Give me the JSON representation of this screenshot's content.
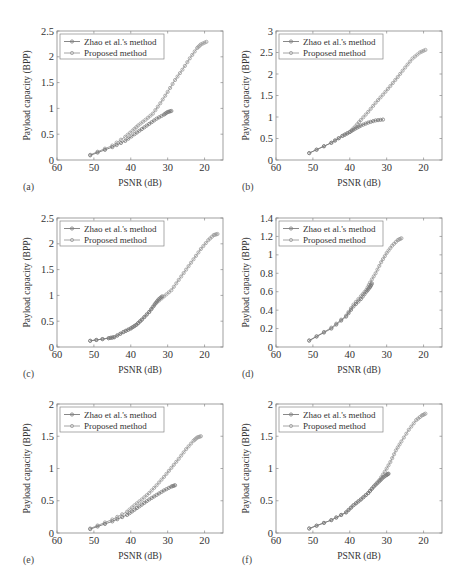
{
  "figure": {
    "xlabel": "PSNR (dB)",
    "ylabel": "Payload capacity (BPP)",
    "legend": [
      "Zhao et al.'s method",
      "Proposed method"
    ],
    "series_colors": {
      "zhao": "#7a7a7a",
      "proposed": "#9a9a9a"
    }
  },
  "chart_data": [
    {
      "panel": "(a)",
      "type": "line",
      "xlabel": "PSNR (dB)",
      "ylabel": "Payload capacity (BPP)",
      "xlim": [
        60,
        15
      ],
      "x_reversed": true,
      "xticks": [
        60,
        50,
        40,
        30,
        20
      ],
      "ylim": [
        0,
        2.5
      ],
      "yticks": [
        0,
        0.5,
        1,
        1.5,
        2,
        2.5
      ],
      "ytick_labels": [
        "0",
        "0.5",
        "1",
        "1.5",
        "2",
        "2.5"
      ],
      "legend_position": "upper left",
      "grid": false,
      "series": [
        {
          "name": "Zhao et al.'s method",
          "x": [
            51,
            45,
            41.5,
            39,
            37,
            35,
            33,
            31,
            30,
            29
          ],
          "y": [
            0.09,
            0.25,
            0.37,
            0.5,
            0.6,
            0.7,
            0.8,
            0.88,
            0.93,
            0.95
          ]
        },
        {
          "name": "Proposed method",
          "x": [
            51,
            45,
            41.5,
            39.5,
            38,
            36,
            34,
            32,
            30,
            28,
            26,
            24,
            22,
            21,
            19.5
          ],
          "y": [
            0.1,
            0.28,
            0.45,
            0.57,
            0.67,
            0.78,
            0.9,
            1.1,
            1.32,
            1.55,
            1.75,
            1.97,
            2.17,
            2.24,
            2.29
          ]
        }
      ]
    },
    {
      "panel": "(b)",
      "type": "line",
      "xlabel": "PSNR (dB)",
      "ylabel": "Payload capacity (BPP)",
      "xlim": [
        60,
        15
      ],
      "x_reversed": true,
      "xticks": [
        60,
        50,
        40,
        30,
        20
      ],
      "ylim": [
        0,
        3
      ],
      "yticks": [
        0,
        0.5,
        1,
        1.5,
        2,
        2.5,
        3
      ],
      "ytick_labels": [
        "0",
        "0.5",
        "1",
        "1.5",
        "2",
        "2.5",
        "3"
      ],
      "legend_position": "upper left",
      "grid": false,
      "series": [
        {
          "name": "Zhao et al.'s method",
          "x": [
            51,
            45,
            42,
            40,
            38.5,
            37,
            35,
            33,
            31
          ],
          "y": [
            0.16,
            0.4,
            0.56,
            0.65,
            0.73,
            0.8,
            0.87,
            0.92,
            0.94
          ]
        },
        {
          "name": "Proposed method",
          "x": [
            51,
            45,
            42,
            40,
            38.5,
            37,
            35,
            33,
            31,
            29,
            27,
            25,
            23,
            21,
            19.5
          ],
          "y": [
            0.16,
            0.4,
            0.56,
            0.65,
            0.78,
            0.93,
            1.12,
            1.33,
            1.52,
            1.72,
            1.93,
            2.15,
            2.36,
            2.5,
            2.56
          ]
        }
      ]
    },
    {
      "panel": "(c)",
      "type": "line",
      "xlabel": "PSNR (dB)",
      "ylabel": "Payload capacity (BPP)",
      "xlim": [
        60,
        15
      ],
      "x_reversed": true,
      "xticks": [
        60,
        50,
        40,
        30,
        20
      ],
      "ylim": [
        0,
        2.5
      ],
      "yticks": [
        0,
        0.5,
        1,
        1.5,
        2,
        2.5
      ],
      "ytick_labels": [
        "0",
        "0.5",
        "1",
        "1.5",
        "2",
        "2.5"
      ],
      "legend_position": "upper left",
      "grid": false,
      "series": [
        {
          "name": "Zhao et al.'s method",
          "x": [
            51,
            46,
            44.5,
            42,
            40,
            38.5,
            37,
            35,
            33.5,
            32.5,
            31.5
          ],
          "y": [
            0.12,
            0.17,
            0.19,
            0.29,
            0.36,
            0.43,
            0.53,
            0.68,
            0.83,
            0.92,
            0.98
          ]
        },
        {
          "name": "Proposed method",
          "x": [
            51,
            46,
            44.5,
            42,
            40,
            38.5,
            37,
            35,
            33,
            31,
            29,
            27,
            25,
            23,
            21,
            19,
            17.5,
            16.5
          ],
          "y": [
            0.12,
            0.17,
            0.19,
            0.29,
            0.36,
            0.43,
            0.53,
            0.68,
            0.86,
            0.98,
            1.1,
            1.3,
            1.5,
            1.7,
            1.9,
            2.07,
            2.17,
            2.19
          ]
        }
      ]
    },
    {
      "panel": "(d)",
      "type": "line",
      "xlabel": "PSNR (dB)",
      "ylabel": "Payload capacity (BPP)",
      "xlim": [
        60,
        15
      ],
      "x_reversed": true,
      "xticks": [
        60,
        50,
        40,
        30,
        20
      ],
      "ylim": [
        0,
        1.4
      ],
      "yticks": [
        0,
        0.2,
        0.4,
        0.6,
        0.8,
        1,
        1.2,
        1.4
      ],
      "ytick_labels": [
        "0",
        "0.2",
        "0.4",
        "0.6",
        "0.8",
        "1",
        "1.2",
        "1.4"
      ],
      "legend_position": "upper left",
      "grid": false,
      "series": [
        {
          "name": "Zhao et al.'s method",
          "x": [
            51,
            45,
            41,
            39,
            37,
            35.5,
            34.5,
            34
          ],
          "y": [
            0.07,
            0.2,
            0.33,
            0.44,
            0.52,
            0.6,
            0.65,
            0.69
          ]
        },
        {
          "name": "Proposed method",
          "x": [
            51,
            45,
            41,
            39,
            37,
            35.5,
            34.5,
            33,
            31.5,
            30,
            28.5,
            27,
            26
          ],
          "y": [
            0.07,
            0.21,
            0.34,
            0.46,
            0.55,
            0.62,
            0.7,
            0.8,
            0.92,
            1.02,
            1.1,
            1.16,
            1.18
          ]
        }
      ]
    },
    {
      "panel": "(e)",
      "type": "line",
      "xlabel": "PSNR (dB)",
      "ylabel": "Payload capacity (BPP)",
      "xlim": [
        60,
        15
      ],
      "x_reversed": true,
      "xticks": [
        60,
        50,
        40,
        30,
        20
      ],
      "ylim": [
        0,
        2
      ],
      "yticks": [
        0,
        0.5,
        1,
        1.5,
        2
      ],
      "ytick_labels": [
        "0",
        "0.5",
        "1",
        "1.5",
        "2"
      ],
      "legend_position": "upper left",
      "grid": false,
      "series": [
        {
          "name": "Zhao et al.'s method",
          "x": [
            51,
            45,
            41,
            39,
            37,
            35,
            33,
            31,
            29,
            28
          ],
          "y": [
            0.06,
            0.18,
            0.28,
            0.36,
            0.44,
            0.52,
            0.59,
            0.66,
            0.72,
            0.74
          ]
        },
        {
          "name": "Proposed method",
          "x": [
            51,
            45,
            41,
            39,
            37,
            35,
            33,
            31,
            29,
            27,
            25,
            23,
            22,
            21
          ],
          "y": [
            0.07,
            0.21,
            0.33,
            0.43,
            0.52,
            0.62,
            0.74,
            0.87,
            1.01,
            1.15,
            1.3,
            1.43,
            1.48,
            1.5
          ]
        }
      ]
    },
    {
      "panel": "(f)",
      "type": "line",
      "xlabel": "PSNR (dB)",
      "ylabel": "Payload capacity (BPP)",
      "xlim": [
        60,
        15
      ],
      "x_reversed": true,
      "xticks": [
        60,
        50,
        40,
        30,
        20
      ],
      "ylim": [
        0,
        2
      ],
      "yticks": [
        0,
        0.5,
        1,
        1.5,
        2
      ],
      "ytick_labels": [
        "0",
        "0.5",
        "1",
        "1.5",
        "2"
      ],
      "legend_position": "upper left",
      "grid": false,
      "series": [
        {
          "name": "Zhao et al.'s method",
          "x": [
            51,
            45,
            41,
            39,
            37,
            35,
            33.5,
            32,
            31,
            30,
            29.5
          ],
          "y": [
            0.07,
            0.2,
            0.32,
            0.43,
            0.52,
            0.62,
            0.72,
            0.8,
            0.86,
            0.9,
            0.92
          ]
        },
        {
          "name": "Proposed method",
          "x": [
            51,
            45,
            41,
            39,
            37,
            35,
            33.5,
            32,
            30.5,
            29,
            27.5,
            26,
            24,
            22,
            20.5,
            19.5
          ],
          "y": [
            0.07,
            0.2,
            0.32,
            0.43,
            0.52,
            0.62,
            0.72,
            0.82,
            0.95,
            1.1,
            1.28,
            1.42,
            1.6,
            1.75,
            1.82,
            1.85
          ]
        }
      ]
    }
  ],
  "panels": [
    {
      "id": "a",
      "label": "(a)",
      "left": 0,
      "top": 0
    },
    {
      "id": "b",
      "label": "(b)",
      "left": 233,
      "top": 0
    },
    {
      "id": "c",
      "label": "(c)",
      "left": 0,
      "top": 188
    },
    {
      "id": "d",
      "label": "(d)",
      "left": 233,
      "top": 188
    },
    {
      "id": "e",
      "label": "(e)",
      "left": 0,
      "top": 374
    },
    {
      "id": "f",
      "label": "(f)",
      "left": 233,
      "top": 374
    }
  ]
}
